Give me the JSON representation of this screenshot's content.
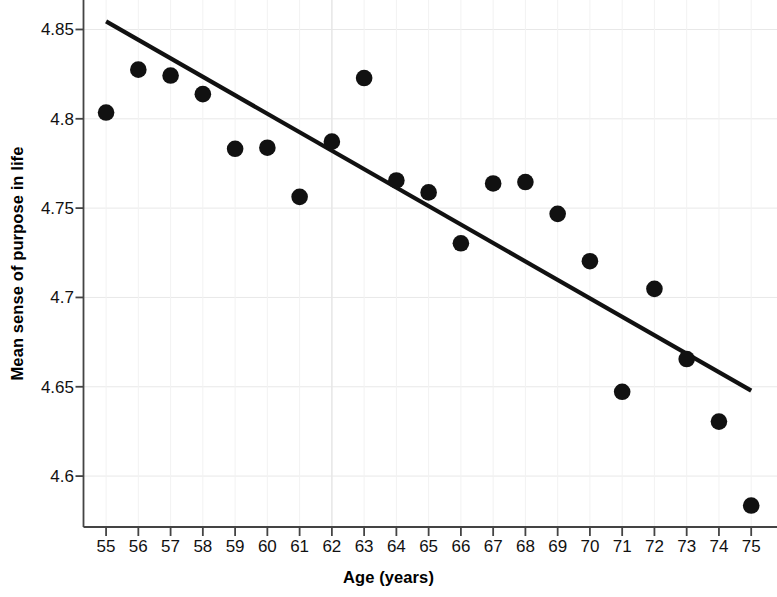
{
  "chart_data": {
    "type": "scatter",
    "title": "",
    "xlabel": "Age (years)",
    "ylabel": "Mean sense of purpose in life",
    "xlim": [
      54.3,
      75.8
    ],
    "ylim": [
      4.5715,
      4.8665
    ],
    "grid": true,
    "x": [
      55,
      56,
      57,
      58,
      59,
      60,
      61,
      62,
      63,
      64,
      65,
      66,
      67,
      68,
      69,
      70,
      71,
      72,
      73,
      74,
      75
    ],
    "y": [
      4.8035,
      4.8275,
      4.8242,
      4.8138,
      4.7832,
      4.7838,
      4.7563,
      4.7872,
      4.8228,
      4.7655,
      4.7588,
      4.7303,
      4.7638,
      4.7646,
      4.7468,
      4.7203,
      4.6472,
      4.7048,
      4.6655,
      4.6305,
      4.5835
    ],
    "xticks": [
      55,
      56,
      57,
      58,
      59,
      60,
      61,
      62,
      63,
      64,
      65,
      66,
      67,
      68,
      69,
      70,
      71,
      72,
      73,
      74,
      75
    ],
    "xtick_labels": [
      "55",
      "56",
      "57",
      "58",
      "59",
      "60",
      "61",
      "62",
      "63",
      "64",
      "65",
      "66",
      "67",
      "68",
      "69",
      "70",
      "71",
      "72",
      "73",
      "74",
      "75"
    ],
    "yticks": [
      4.6,
      4.65,
      4.7,
      4.75,
      4.8,
      4.85
    ],
    "ytick_labels": [
      "4.6",
      "4.65",
      "4.7",
      "4.75",
      "4.8",
      "4.85"
    ],
    "series": [
      {
        "name": "Mean sense of purpose in life",
        "marker": "filled-circle",
        "color": "#111111",
        "values": [
          4.8035,
          4.8275,
          4.8242,
          4.8138,
          4.7832,
          4.7838,
          4.7563,
          4.7872,
          4.8228,
          4.7655,
          4.7588,
          4.7303,
          4.7638,
          4.7646,
          4.7468,
          4.7203,
          4.6472,
          4.7048,
          4.6655,
          4.6305,
          4.5835
        ]
      }
    ],
    "trendline": {
      "name": "linear fit",
      "color": "#111111",
      "x_start": 55,
      "x_end": 75,
      "y_start": 4.8545,
      "y_end": 4.6478
    },
    "marker_color": "#111111",
    "grid_color": "#e8e8e8",
    "axis_color": "#444444",
    "background": "#ffffff"
  },
  "axes": {
    "x_title": "Age (years)",
    "y_title": "Mean sense of purpose in life"
  }
}
